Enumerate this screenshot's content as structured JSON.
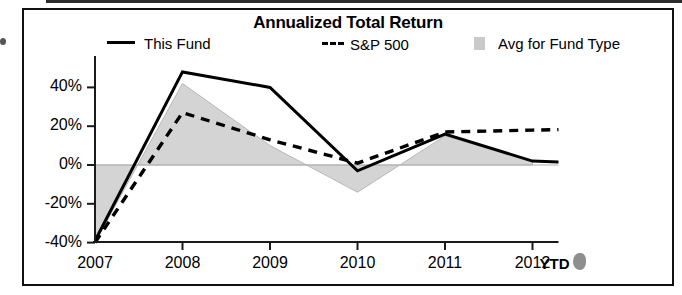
{
  "chart_data": {
    "type": "line",
    "title": "Annualized Total Return",
    "xlabel": "",
    "ylabel": "",
    "x": [
      "2007",
      "2008",
      "2009",
      "2010",
      "2011",
      "2012"
    ],
    "x_axis_suffix": "YTD",
    "categories": [
      "2007",
      "2008",
      "2009",
      "2010",
      "2011",
      "2012"
    ],
    "ytick_labels": [
      "40%",
      "20%",
      "0%",
      "-20%",
      "-40%"
    ],
    "ytick_values": [
      40,
      20,
      0,
      -20,
      -40
    ],
    "ylim": [
      -42,
      52
    ],
    "grid": false,
    "legend_position": "top",
    "series": [
      {
        "name": "This Fund",
        "style": "solid",
        "color": "#000000",
        "values": [
          -39,
          48,
          40,
          -3,
          16,
          2
        ]
      },
      {
        "name": "S&P 500",
        "style": "dashed",
        "color": "#000000",
        "values": [
          -40,
          27,
          13,
          1,
          17,
          18
        ]
      },
      {
        "name": "Avg for Fund Type",
        "style": "area",
        "color": "#d4d4d4",
        "values": [
          -40,
          42,
          10,
          -14,
          15,
          2
        ]
      }
    ]
  },
  "legend": {
    "items": [
      {
        "label": "This Fund",
        "swatch": "solid-line-swatch"
      },
      {
        "label": "S&P 500",
        "swatch": "dashed-line-swatch"
      },
      {
        "label": "Avg for Fund Type",
        "swatch": "shaded-area-swatch"
      }
    ]
  }
}
